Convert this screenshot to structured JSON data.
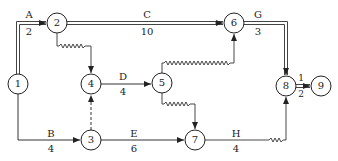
{
  "diagram": {
    "type": "double-code network diagram (time-scaled, critical path)",
    "nodes": [
      {
        "id": "1",
        "label": "1",
        "x": 18,
        "y": 84
      },
      {
        "id": "2",
        "label": "2",
        "x": 57,
        "y": 23
      },
      {
        "id": "3",
        "label": "3",
        "x": 91,
        "y": 140
      },
      {
        "id": "4",
        "label": "4",
        "x": 91,
        "y": 84
      },
      {
        "id": "5",
        "label": "5",
        "x": 162,
        "y": 83
      },
      {
        "id": "6",
        "label": "6",
        "x": 234,
        "y": 23
      },
      {
        "id": "7",
        "label": "7",
        "x": 195,
        "y": 140
      },
      {
        "id": "8",
        "label": "8",
        "x": 286,
        "y": 86
      },
      {
        "id": "9",
        "label": "9",
        "x": 321,
        "y": 86
      }
    ],
    "activities": [
      {
        "name": "A",
        "duration": "2",
        "from": "1",
        "to": "2",
        "critical": true
      },
      {
        "name": "B",
        "duration": "4",
        "from": "1",
        "to": "3",
        "critical": false
      },
      {
        "name": "C",
        "duration": "10",
        "from": "2",
        "to": "6",
        "critical": true
      },
      {
        "name": "D",
        "duration": "4",
        "from": "4",
        "to": "5",
        "critical": false
      },
      {
        "name": "E",
        "duration": "6",
        "from": "3",
        "to": "7",
        "critical": false
      },
      {
        "name": "G",
        "duration": "3",
        "from": "6",
        "to": "8",
        "critical": true
      },
      {
        "name": "H",
        "duration": "4",
        "from": "7",
        "to": "8",
        "critical": false
      },
      {
        "name": "I",
        "duration": "2",
        "from": "8",
        "to": "9",
        "critical": true,
        "display_name": "1"
      }
    ],
    "dummies": [
      {
        "from": "3",
        "to": "4",
        "style": "dashed"
      }
    ],
    "free_floats": [
      {
        "from": "2",
        "to": "4",
        "style": "wavy"
      },
      {
        "from": "5",
        "to": "6",
        "style": "wavy"
      },
      {
        "from": "5",
        "to": "7",
        "style": "wavy"
      },
      {
        "from": "7",
        "to": "8",
        "style": "wavy"
      }
    ]
  },
  "labels": {
    "A": "A",
    "A_dur": "2",
    "B": "B",
    "B_dur": "4",
    "C": "C",
    "C_dur": "10",
    "D": "D",
    "D_dur": "4",
    "E": "E",
    "E_dur": "6",
    "G": "G",
    "G_dur": "3",
    "H": "H",
    "H_dur": "4",
    "I": "1",
    "I_dur": "2"
  },
  "colors": {
    "line": "#333333",
    "critical": "#444444",
    "background": "#ffffff"
  }
}
